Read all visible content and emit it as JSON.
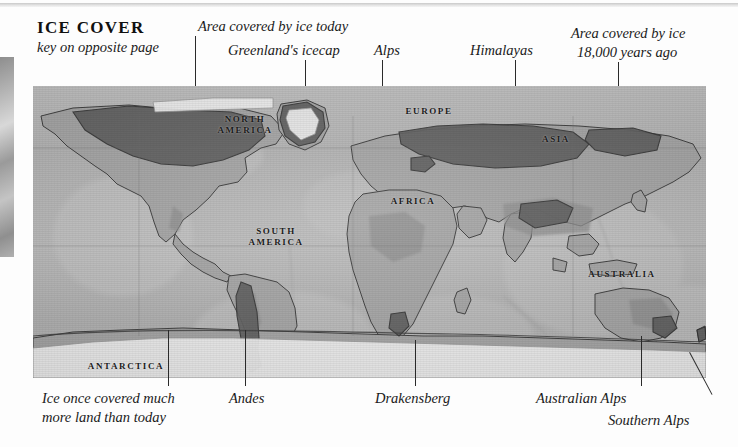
{
  "figure": {
    "title": "ICE COVER",
    "subtitle": "key on opposite page",
    "type": "map"
  },
  "callouts_top": [
    {
      "id": "area-today",
      "text": "Area covered by ice today"
    },
    {
      "id": "greenland",
      "text": "Greenland's icecap"
    },
    {
      "id": "alps",
      "text": "Alps"
    },
    {
      "id": "himalayas",
      "text": "Himalayas"
    },
    {
      "id": "area-18000-l1",
      "text": "Area covered by ice"
    },
    {
      "id": "area-18000-l2",
      "text": "18,000 years ago"
    }
  ],
  "callouts_bottom": [
    {
      "id": "ice-once-l1",
      "text": "Ice once covered much"
    },
    {
      "id": "ice-once-l2",
      "text": "more land than today"
    },
    {
      "id": "andes",
      "text": "Andes"
    },
    {
      "id": "drakensberg",
      "text": "Drakensberg"
    },
    {
      "id": "australian-alps",
      "text": "Australian Alps"
    },
    {
      "id": "southern-alps",
      "text": "Southern Alps"
    }
  ],
  "map_labels": [
    {
      "id": "north-america",
      "text": "NORTH\nAMERICA"
    },
    {
      "id": "south-america",
      "text": "SOUTH\nAMERICA"
    },
    {
      "id": "europe",
      "text": "EUROPE"
    },
    {
      "id": "asia",
      "text": "ASIA"
    },
    {
      "id": "africa",
      "text": "AFRICA"
    },
    {
      "id": "australia",
      "text": "AUSTRALIA"
    },
    {
      "id": "antarctica",
      "text": "ANTARCTICA"
    }
  ],
  "colors": {
    "paper": "#fdfdfd",
    "ocean": "#b9b9b9",
    "land": "#a8a8a8",
    "ice_today": "#f2f2f2",
    "ice_18000": "#5f5f5f",
    "ink": "#1a1a1a"
  }
}
